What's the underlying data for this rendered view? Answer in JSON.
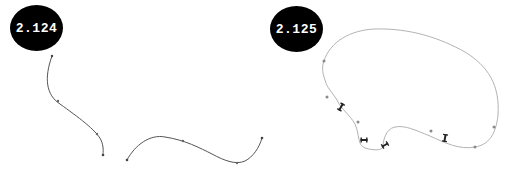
{
  "figures": [
    {
      "label": "2.124",
      "description": "Two open curves: an S-shaped descending curve and a wave-shaped curve"
    },
    {
      "label": "2.125",
      "description": "Closed loop curve with control point dots and crossed handle markers"
    }
  ],
  "colors": {
    "badge_bg": "#000000",
    "badge_text": "#ffffff",
    "curve_left": "#555555",
    "curve_right": "#b0b0b0",
    "point": "#888888",
    "handle": "#222222"
  }
}
